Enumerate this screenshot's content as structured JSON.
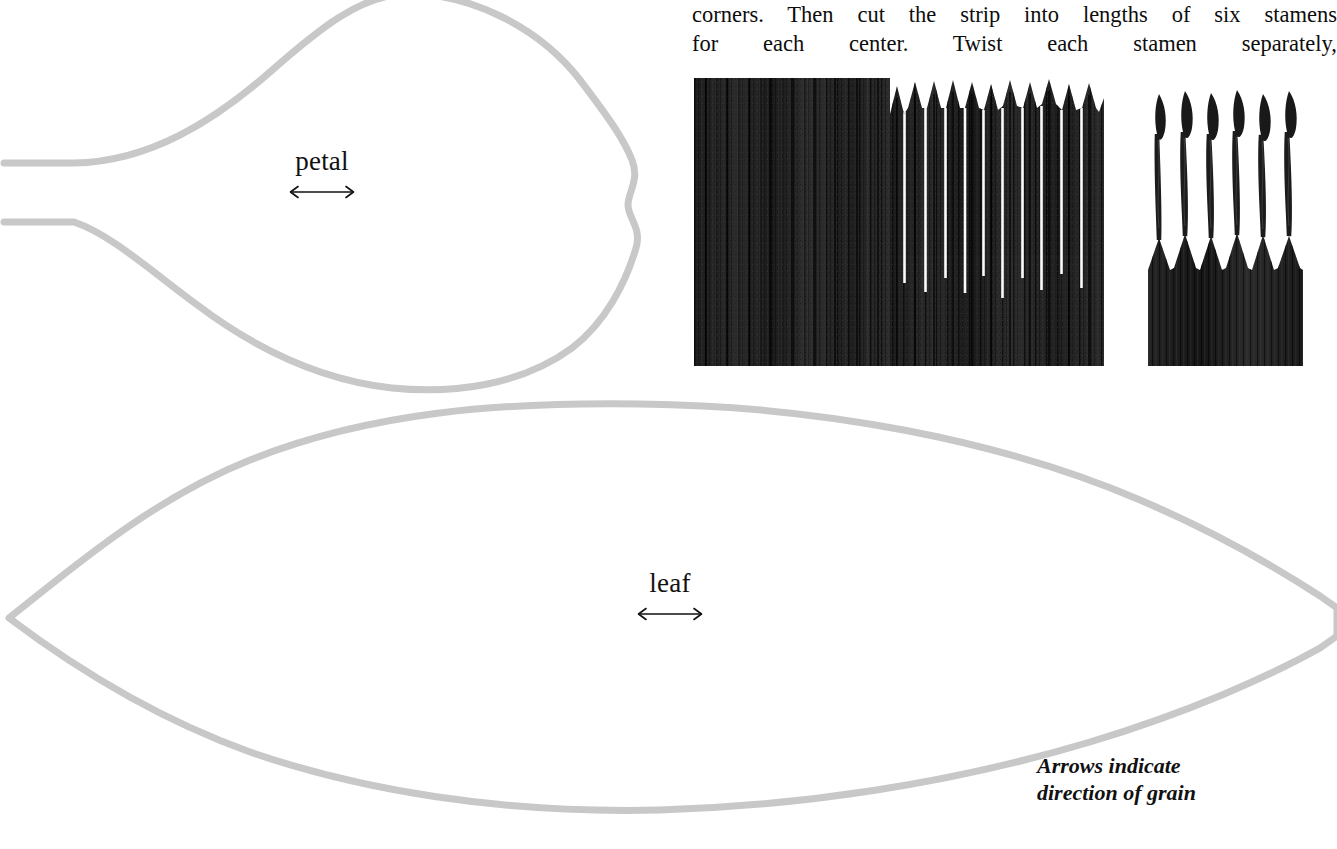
{
  "page": {
    "background_color": "#ffffff",
    "outline_color": "#c8c8c8",
    "text_color": "#111111",
    "photo_ink_color": "#1a1a1a"
  },
  "instructions": {
    "line1": "corners. Then cut the strip into lengths of six stamens",
    "line2": "for each center. Twist each stamen separately,"
  },
  "patterns": [
    {
      "id": "petal",
      "label": "petal",
      "grain_arrow": "double-headed-horizontal-arrow"
    },
    {
      "id": "leaf",
      "label": "leaf",
      "grain_arrow": "double-headed-horizontal-arrow"
    }
  ],
  "caption": {
    "line1": "Arrows indicate",
    "line2": "direction of grain"
  },
  "photos": [
    {
      "id": "fringed-strip",
      "description": "crepe paper strip fringed with vertical cuts, right half cut to points"
    },
    {
      "id": "twisted-stamens",
      "description": "six twisted stamens with diamond shaped heads on a solid base"
    }
  ]
}
